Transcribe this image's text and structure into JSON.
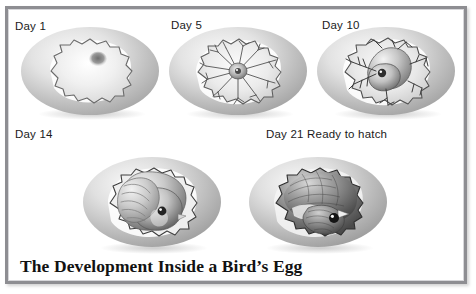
{
  "figure": {
    "title": "The Development Inside a Bird’s Egg",
    "frame_border_color": "#8e8e92",
    "background_color": "#ffffff",
    "text_color": "#1b1b1b",
    "shell_color": "#bdbdbd",
    "shell_highlight": "#f2f2f2",
    "embryo_color": "#8a8a8a"
  },
  "stages": [
    {
      "id": "day-1",
      "label": "Day 1",
      "description": "blastodisc with pale yolk and germinal spot"
    },
    {
      "id": "day-5",
      "label": "Day 5",
      "description": "small embryo with spreading blood vessel network"
    },
    {
      "id": "day-10",
      "label": "Day 10",
      "description": "curled embryo with visible eye and dense vessels"
    },
    {
      "id": "day-14",
      "label": "Day 14",
      "description": "chick with formed head, beak and folded wing"
    },
    {
      "id": "day-21",
      "label": "Day 21 Ready to hatch",
      "description": "fully feathered chick filling the shell"
    }
  ]
}
